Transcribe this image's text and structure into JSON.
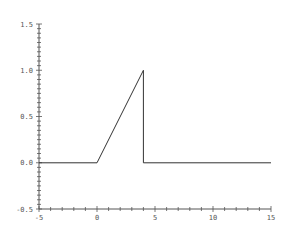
{
  "chart_data": {
    "type": "line",
    "title": "",
    "xlabel": "",
    "ylabel": "",
    "xlim": [
      -5,
      15
    ],
    "ylim": [
      -0.5,
      1.5
    ],
    "grid": false,
    "legend": null,
    "x_ticks_major": [
      -5,
      0,
      5,
      10,
      15
    ],
    "x_tick_labels": [
      "-5",
      "0",
      "5",
      "10",
      "15"
    ],
    "y_ticks_major": [
      -0.5,
      0.0,
      0.5,
      1.0,
      1.5
    ],
    "y_tick_labels": [
      "-0.5",
      "0.0",
      "0.5",
      "1.0",
      "1.5"
    ],
    "series": [
      {
        "name": "signal",
        "color": "#333333",
        "x": [
          -5,
          0,
          4,
          4,
          15
        ],
        "y": [
          0,
          0,
          1,
          0,
          0
        ]
      }
    ]
  },
  "style": {
    "axis_color": "#555555",
    "line_color": "#333333"
  }
}
